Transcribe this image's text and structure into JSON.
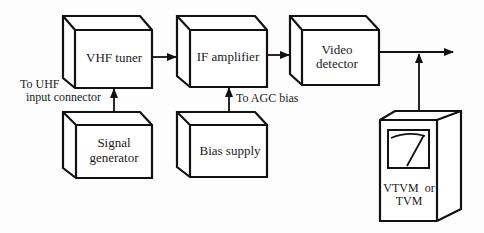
{
  "diagram": {
    "blocks": {
      "vhf_tuner": {
        "label_lines": [
          "VHF tuner"
        ]
      },
      "if_amplifier": {
        "label_lines": [
          "IF amplifier"
        ]
      },
      "video_detector": {
        "label_lines": [
          "Video",
          "detector"
        ]
      },
      "signal_generator": {
        "label_lines": [
          "Signal",
          "generator"
        ]
      },
      "bias_supply": {
        "label_lines": [
          "Bias supply"
        ]
      },
      "meter": {
        "label_lines": [
          "VTVM  or",
          "TVM"
        ]
      }
    },
    "annotations": {
      "uhf_line1": "To UHF",
      "uhf_line2": "input connector",
      "agc": "To AGC bias"
    },
    "connections": [
      {
        "from": "vhf_tuner",
        "to": "if_amplifier"
      },
      {
        "from": "if_amplifier",
        "to": "video_detector"
      },
      {
        "from": "video_detector",
        "to": "output"
      },
      {
        "from": "signal_generator",
        "to": "vhf_tuner",
        "note": "To UHF input connector"
      },
      {
        "from": "bias_supply",
        "to": "if_amplifier",
        "note": "To AGC bias"
      },
      {
        "from": "meter",
        "to": "video_detector_output"
      }
    ],
    "colors": {
      "line": "#111111",
      "background": "#fdfdfd",
      "box_fill": "#ffffff"
    }
  }
}
